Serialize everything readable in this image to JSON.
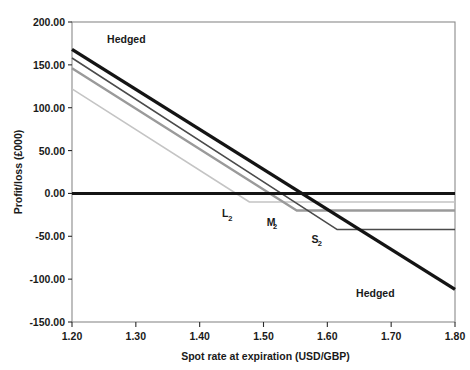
{
  "chart_data": {
    "type": "line",
    "title": "",
    "xlabel": "Spot rate at expiration (USD/GBP)",
    "ylabel": "Profit/loss (£000)",
    "xlim": [
      1.2,
      1.8
    ],
    "ylim": [
      -150.0,
      200.0
    ],
    "xticks": [
      "1.20",
      "1.30",
      "1.40",
      "1.50",
      "1.60",
      "1.70",
      "1.80"
    ],
    "xtick_values": [
      1.2,
      1.3,
      1.4,
      1.5,
      1.6,
      1.7,
      1.8
    ],
    "yticks": [
      "200.00",
      "150.00",
      "100.00",
      "50.00",
      "0.00",
      "-50.00",
      "-100.00",
      "-150.00"
    ],
    "ytick_values": [
      200,
      150,
      100,
      50,
      0,
      -50,
      -100,
      -150
    ],
    "grid": false,
    "legend_position": "inline-annotations",
    "series": [
      {
        "name": "Hedged",
        "color": "#141414",
        "width": 3.4,
        "points": [
          [
            1.2,
            168
          ],
          [
            1.8,
            -112
          ]
        ]
      },
      {
        "name": "Zero line",
        "color": "#141414",
        "width": 3.0,
        "points": [
          [
            1.2,
            0
          ],
          [
            1.8,
            0
          ]
        ]
      },
      {
        "name": "S2",
        "color": "#4a4a4a",
        "width": 1.5,
        "points": [
          [
            1.2,
            158
          ],
          [
            1.615,
            -42
          ],
          [
            1.8,
            -42
          ]
        ]
      },
      {
        "name": "M2",
        "color": "#9a9a9a",
        "width": 2.4,
        "points": [
          [
            1.2,
            146
          ],
          [
            1.552,
            -20
          ],
          [
            1.8,
            -20
          ]
        ]
      },
      {
        "name": "L2",
        "color": "#c4c4c4",
        "width": 1.5,
        "points": [
          [
            1.2,
            122
          ],
          [
            1.478,
            -10
          ],
          [
            1.8,
            -10
          ]
        ]
      }
    ],
    "annotations": [
      {
        "text": "Hedged",
        "sub": "",
        "x": 1.255,
        "y": 176,
        "name": "hedged-label-upper"
      },
      {
        "text": "Hedged",
        "sub": "",
        "x": 1.645,
        "y": -121,
        "name": "hedged-label-lower"
      },
      {
        "text": "L",
        "sub": "2",
        "x": 1.435,
        "y": -28,
        "name": "l2-label"
      },
      {
        "text": "M",
        "sub": "2",
        "x": 1.505,
        "y": -38,
        "name": "m2-label"
      },
      {
        "text": "S",
        "sub": "2",
        "x": 1.575,
        "y": -58,
        "name": "s2-label"
      }
    ]
  }
}
